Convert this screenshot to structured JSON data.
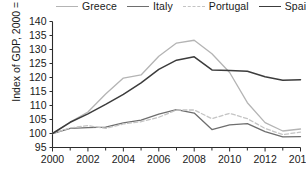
{
  "chart_data": {
    "type": "line",
    "title": "",
    "xlabel": "",
    "ylabel": "Index of GDP, 2000 = 100",
    "xlim": [
      2000,
      2014
    ],
    "ylim": [
      95,
      140
    ],
    "ytick_step": 5,
    "xtick_step": 2,
    "grid": false,
    "legend_position": "top",
    "x": [
      2000,
      2001,
      2002,
      2003,
      2004,
      2005,
      2006,
      2007,
      2008,
      2009,
      2010,
      2011,
      2012,
      2013,
      2014
    ],
    "yticks": [
      95,
      100,
      105,
      110,
      115,
      120,
      125,
      130,
      135,
      140
    ],
    "xticks": [
      2000,
      2002,
      2004,
      2006,
      2008,
      2010,
      2012,
      2014
    ],
    "xtick_labels": [
      "2000",
      "2002",
      "2004",
      "2006",
      "2008",
      "2010",
      "2012",
      "2014"
    ],
    "ytick_labels": [
      "95",
      "100",
      "105",
      "110",
      "115",
      "120",
      "125",
      "130",
      "135",
      "140"
    ],
    "series": [
      {
        "name": "Greece",
        "color": "#b4b4b4",
        "style": "solid",
        "values": [
          100.0,
          104.1,
          107.7,
          114.1,
          119.8,
          120.9,
          127.6,
          132.3,
          133.3,
          128.5,
          121.8,
          111.0,
          103.9,
          100.9,
          101.6
        ]
      },
      {
        "name": "Italy",
        "color": "#6e6e6e",
        "style": "solid",
        "values": [
          100.0,
          101.8,
          102.1,
          102.3,
          103.8,
          104.8,
          106.9,
          108.5,
          107.3,
          101.4,
          103.1,
          103.5,
          100.7,
          98.8,
          98.9
        ]
      },
      {
        "name": "Portugal",
        "color": "#c4c4c4",
        "style": "dashed",
        "values": [
          100.0,
          102.0,
          102.8,
          101.8,
          103.4,
          104.2,
          105.8,
          108.4,
          108.4,
          105.3,
          107.2,
          105.3,
          101.8,
          99.6,
          100.5
        ]
      },
      {
        "name": "Spain",
        "color": "#3c3c3c",
        "style": "solid",
        "values": [
          100.0,
          104.0,
          107.0,
          110.4,
          114.0,
          118.1,
          122.9,
          126.2,
          127.4,
          122.7,
          122.5,
          122.2,
          120.3,
          119.0,
          119.2
        ]
      }
    ]
  },
  "legend": {
    "items": [
      {
        "label": "Greece"
      },
      {
        "label": "Italy"
      },
      {
        "label": "Portugal"
      },
      {
        "label": "Spain"
      }
    ]
  },
  "axes": {
    "y_title": "Index of GDP, 2000 = 100"
  }
}
